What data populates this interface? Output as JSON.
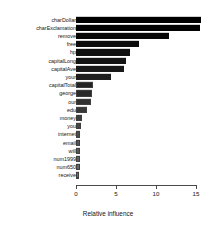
{
  "chart_data": {
    "type": "bar",
    "orientation": "horizontal",
    "title": "",
    "xlabel": "Relative influence",
    "ylabel": "",
    "xlim": [
      0,
      15.8
    ],
    "xticks": [
      0,
      5,
      10,
      15
    ],
    "xtick_labels": [
      "0",
      "5",
      "10",
      "15"
    ],
    "grid": false,
    "legend": false,
    "categories": [
      "charDollar",
      "charExclamation",
      "remove",
      "free",
      "hp",
      "capitalLong",
      "capitalAve",
      "your",
      "capitalTotal",
      "george",
      "our",
      "edu",
      "money",
      "you",
      "internet",
      "email",
      "will",
      "num1999",
      "num650",
      "receive"
    ],
    "values": [
      15.6,
      15.5,
      11.6,
      7.9,
      6.8,
      6.3,
      6.0,
      4.4,
      2.1,
      2.0,
      1.9,
      1.4,
      0.7,
      0.6,
      0.55,
      0.5,
      0.5,
      0.45,
      0.45,
      0.4
    ],
    "bar_colors": [
      "#000000",
      "#030303",
      "#070707",
      "#0b0b0b",
      "#0f0f0f",
      "#141414",
      "#191919",
      "#1e1e1e",
      "#242424",
      "#2a2a2a",
      "#303030",
      "#373737",
      "#3e3e3e",
      "#454545",
      "#4c4c4c",
      "#535353",
      "#5a5a5a",
      "#616161",
      "#676767",
      "#6d6d6d"
    ]
  }
}
